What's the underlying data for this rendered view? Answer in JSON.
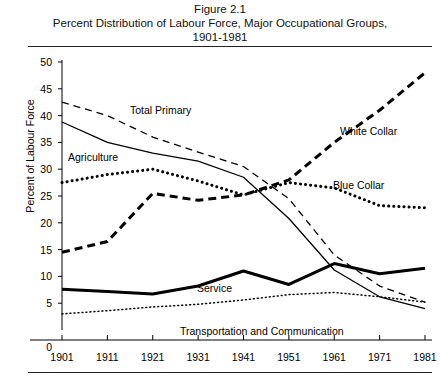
{
  "figure": {
    "title_lines": [
      "Figure 2.1",
      "Percent Distribution of Labour Force, Major Occupational Groups,",
      "1901-1981"
    ]
  },
  "axes": {
    "ylabel": "Percent of Labour Force",
    "yticks": [
      "50",
      "45",
      "40",
      "35",
      "30",
      "25",
      "20",
      "15",
      "10",
      "5",
      "0"
    ],
    "xticks": [
      "1901",
      "1911",
      "1921",
      "1931",
      "1941",
      "1951",
      "1961",
      "1971",
      "1981"
    ]
  },
  "series_labels": {
    "total_primary": "Total Primary",
    "agriculture": "Agriculture",
    "white_collar": "White Collar",
    "blue_collar": "Blue Collar",
    "service": "Service",
    "transportation": "Transportation and Communication"
  },
  "chart_data": {
    "type": "line",
    "title": "Percent Distribution of Labour Force, Major Occupational Groups, 1901-1981",
    "xlabel": "",
    "ylabel": "Percent of Labour Force",
    "x": [
      1901,
      1911,
      1921,
      1931,
      1941,
      1951,
      1961,
      1971,
      1981
    ],
    "xlim": [
      1901,
      1981
    ],
    "ylim": [
      0,
      50
    ],
    "ytick_step": 5,
    "grid": false,
    "legend": "inline-annotations",
    "series": [
      {
        "name": "Total Primary",
        "style": "dashed-thin",
        "color": "#000000",
        "values": [
          42.5,
          40.0,
          36.0,
          33.2,
          30.5,
          24.5,
          14.0,
          8.2,
          5.2
        ]
      },
      {
        "name": "Agriculture",
        "style": "solid-thin",
        "color": "#000000",
        "values": [
          38.8,
          35.0,
          33.0,
          31.5,
          28.5,
          20.8,
          11.2,
          6.2,
          4.0
        ]
      },
      {
        "name": "White Collar",
        "style": "dashed-thick",
        "color": "#000000",
        "values": [
          14.5,
          16.5,
          25.5,
          24.2,
          25.2,
          28.0,
          35.0,
          41.0,
          48.0
        ]
      },
      {
        "name": "Blue Collar",
        "style": "dotted-thick",
        "color": "#000000",
        "values": [
          27.5,
          29.0,
          30.0,
          27.8,
          25.2,
          27.5,
          26.5,
          23.2,
          22.8
        ]
      },
      {
        "name": "Service",
        "style": "solid-thick",
        "color": "#000000",
        "values": [
          7.6,
          7.2,
          6.7,
          8.2,
          11.0,
          8.5,
          12.4,
          10.5,
          11.5
        ]
      },
      {
        "name": "Transportation and Communication",
        "style": "dotted-thin",
        "color": "#000000",
        "values": [
          3.0,
          3.6,
          4.3,
          4.8,
          5.6,
          6.6,
          7.0,
          6.2,
          5.2
        ]
      }
    ]
  }
}
